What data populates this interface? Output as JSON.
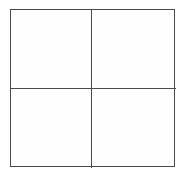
{
  "figure": {
    "canvas": {
      "width": 182,
      "height": 176,
      "background_color": "#ffffff"
    },
    "frame": {
      "x": 10,
      "y": 9,
      "width": 165,
      "height": 158,
      "stroke_color": "#4a4a4a",
      "stroke_width": 1.5,
      "fill_color": "#fefefe"
    },
    "dividers": [
      {
        "name": "vertical-divider",
        "orientation": "vertical",
        "position": 91,
        "stroke_color": "#4a4a4a",
        "stroke_width": 1.5
      },
      {
        "name": "horizontal-divider",
        "orientation": "horizontal",
        "position": 88,
        "stroke_color": "#4a4a4a",
        "stroke_width": 1.5
      }
    ],
    "rows": 2,
    "columns": 2,
    "cells": [
      {
        "id": "top-left",
        "row": 0,
        "column": 0,
        "label": ""
      },
      {
        "id": "top-right",
        "row": 0,
        "column": 1,
        "label": ""
      },
      {
        "id": "bottom-left",
        "row": 1,
        "column": 0,
        "label": ""
      },
      {
        "id": "bottom-right",
        "row": 1,
        "column": 1,
        "label": ""
      }
    ]
  }
}
